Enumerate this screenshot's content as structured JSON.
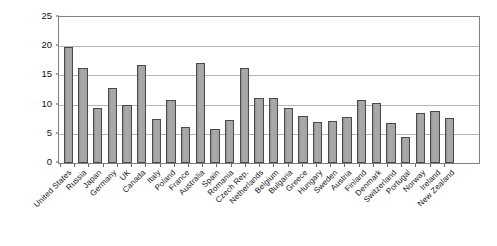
{
  "chart_data": {
    "type": "bar",
    "title": "",
    "xlabel": "",
    "ylabel": "CO2 per capita (t)",
    "ylabel_parts": {
      "pre": "CO",
      "sub": "2",
      "post": " per capita (t)"
    },
    "ylim": [
      0,
      25
    ],
    "yticks": [
      0,
      5,
      10,
      15,
      20,
      25
    ],
    "ytick_labels": [
      "0",
      "5",
      "10",
      "15",
      "20",
      "25"
    ],
    "grid": true,
    "grid_axis": "y",
    "legend": "none",
    "bar_fill_color": "#a0a0a0",
    "bar_edge_color": "#4a4a4a",
    "gridline_color": "#b5b5b5",
    "plot_border_color": "#808080",
    "categories": [
      "United States",
      "Russia",
      "Japan",
      "Germany",
      "UK",
      "Canada",
      "Italy",
      "Poland",
      "France",
      "Australia",
      "Spain",
      "Romania",
      "Czech Rep.",
      "Netherlands",
      "Belgium",
      "Bulgaria",
      "Greece",
      "Hungary",
      "Sweden",
      "Austria",
      "Finland",
      "Denmark",
      "Switzerland",
      "Portugal",
      "Norway",
      "Ireland",
      "New Zealand"
    ],
    "values": [
      19.9,
      16.2,
      9.4,
      12.8,
      10.0,
      16.7,
      7.5,
      10.8,
      6.2,
      17.1,
      5.9,
      7.4,
      16.2,
      11.2,
      11.2,
      9.4,
      8.1,
      7.0,
      7.2,
      7.8,
      10.8,
      10.2,
      6.8,
      4.5,
      8.5,
      8.9,
      7.7
    ]
  }
}
